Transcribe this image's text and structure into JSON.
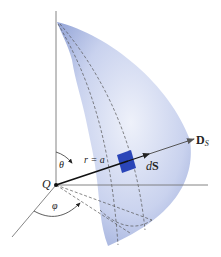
{
  "figure": {
    "labels": {
      "charge": "Q",
      "theta": "θ",
      "phi": "φ",
      "radius": "r = a",
      "surface_element": "dS",
      "surface_element_d": "d",
      "surface_element_S": "S",
      "flux_density": "D",
      "flux_density_sub": "S"
    },
    "colors": {
      "surface_light": "#e6ebf7",
      "surface_dark": "#9aaad8",
      "patch": "#2a45b8",
      "line": "#555555",
      "vector": "#111111"
    }
  }
}
